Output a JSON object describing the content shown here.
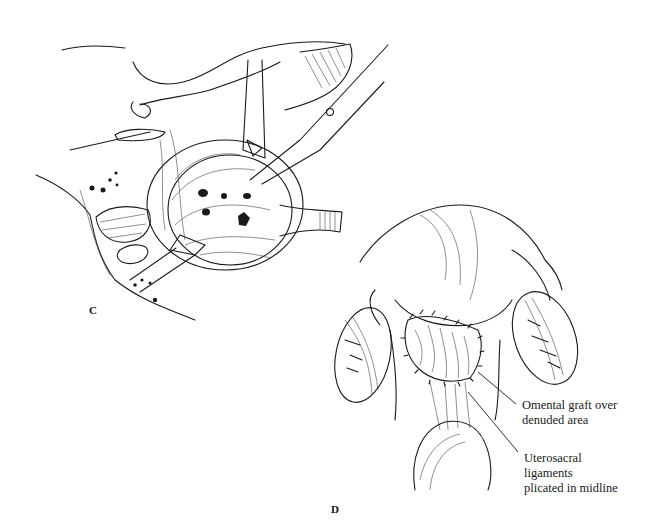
{
  "figure": {
    "panels": [
      {
        "id": "C",
        "label": "C"
      },
      {
        "id": "D",
        "label": "D"
      }
    ],
    "annotations": {
      "omental_graft": {
        "lines": [
          "Omental graft over",
          "denuded area"
        ]
      },
      "uterosacral": {
        "lines": [
          "Uterosacral",
          "ligaments",
          "plicated in midline"
        ]
      }
    }
  }
}
